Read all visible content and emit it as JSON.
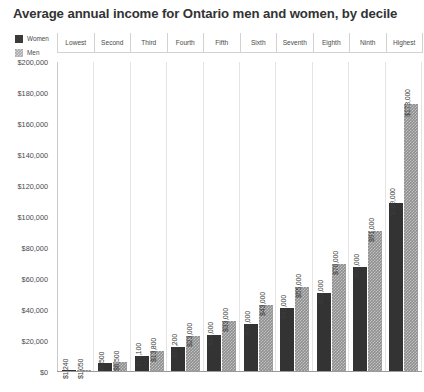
{
  "chart_data": {
    "type": "bar",
    "title": "Average annual income for Ontario men and women, by decile",
    "xlabel": "",
    "ylabel": "",
    "ylim": [
      0,
      200000
    ],
    "ytick_labels": [
      "$200,000",
      "$180,000",
      "$160,000",
      "$140,000",
      "$120,000",
      "$100,000",
      "$80,000",
      "$60,000",
      "$40,000",
      "$20,000",
      "$0"
    ],
    "ytick_values": [
      200000,
      180000,
      160000,
      140000,
      120000,
      100000,
      80000,
      60000,
      40000,
      20000,
      0
    ],
    "grid": "vertical",
    "legend_position": "top-left",
    "categories": [
      "Lowest",
      "Second",
      "Third",
      "Fourth",
      "Fifth",
      "Sixth",
      "Seventh",
      "Eighth",
      "Ninth",
      "Highest"
    ],
    "series": [
      {
        "name": "Women",
        "color": "#333333",
        "values": [
          1240,
          5500,
          10100,
          16200,
          24000,
          31000,
          41000,
          51000,
          68000,
          109000
        ],
        "labels": [
          "$1,240",
          "$5,500",
          "$10,100",
          "$16,200",
          "$24,000",
          "$31,000",
          "$41,000",
          "$51,000",
          "$68,000",
          "$109,000"
        ]
      },
      {
        "name": "Men",
        "color": "#8e8e8e",
        "values": [
          1050,
          6500,
          13800,
          23000,
          33000,
          43000,
          55000,
          70000,
          91000,
          173000
        ],
        "labels": [
          "$1,050",
          "$6,500",
          "$13,800",
          "$23,000",
          "$33,000",
          "$43,000",
          "$55,000",
          "$70,000",
          "$91,000",
          "$173,000"
        ]
      }
    ]
  },
  "legend": {
    "items": [
      {
        "label": "Women",
        "swatch": "women-swatch"
      },
      {
        "label": "Men",
        "swatch": "men-swatch"
      }
    ]
  }
}
